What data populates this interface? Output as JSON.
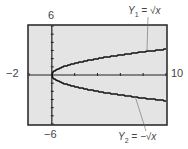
{
  "chart_data": {
    "type": "line",
    "title": "",
    "xlabel": "",
    "ylabel": "",
    "xlim": [
      -2,
      10
    ],
    "ylim": [
      -6,
      6
    ],
    "x_tick_step": 2,
    "y_tick_step": 1,
    "grid": false,
    "background": "#e4e4e4",
    "tick_labels": {
      "xmin": "−2",
      "xmax": "10",
      "ymax": "6",
      "ymin": "−6"
    },
    "series": [
      {
        "name": "Y1 = √x",
        "label_main": "Y",
        "label_sub": "1",
        "label_rhs": "= √x",
        "x": [
          0,
          1,
          2,
          3,
          4,
          5,
          6,
          7,
          8,
          9,
          10
        ],
        "values": [
          0,
          1,
          1.41,
          1.73,
          2,
          2.24,
          2.45,
          2.65,
          2.83,
          3,
          3.16
        ]
      },
      {
        "name": "Y2 = −√x",
        "label_main": "Y",
        "label_sub": "2",
        "label_rhs": "= −√x",
        "x": [
          0,
          1,
          2,
          3,
          4,
          5,
          6,
          7,
          8,
          9,
          10
        ],
        "values": [
          0,
          -1,
          -1.41,
          -1.73,
          -2,
          -2.24,
          -2.45,
          -2.65,
          -2.83,
          -3,
          -3.16
        ]
      }
    ]
  }
}
